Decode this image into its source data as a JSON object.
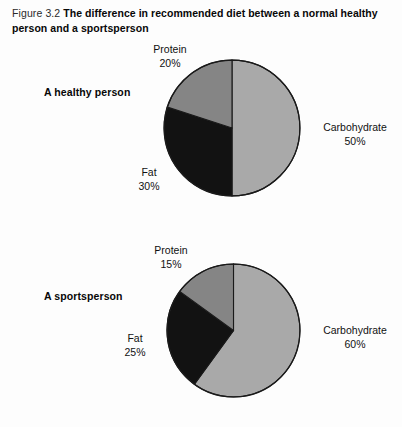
{
  "figure": {
    "number": "Figure 3.2",
    "title": "The difference in recommended diet between a normal healthy person and a sportsperson"
  },
  "colors": {
    "carbohydrate": "#a9a9a9",
    "protein": "#858585",
    "fat": "#121212",
    "outline": "#1a1a1a",
    "background": "#fdfdfd",
    "text": "#111111"
  },
  "chart_data": [
    {
      "type": "pie",
      "title": "A healthy person",
      "categories": [
        "Carbohydrate",
        "Protein",
        "Fat"
      ],
      "values": [
        50,
        30,
        20
      ],
      "labels": [
        "Carbohydrate\n50%",
        "Fat\n30%",
        "Protein\n20%"
      ],
      "slices": [
        {
          "name": "Carbohydrate",
          "value": 50,
          "value_label": "50%",
          "color": "#a9a9a9",
          "start_angle": 0,
          "end_angle": 180
        },
        {
          "name": "Fat",
          "value": 30,
          "value_label": "30%",
          "color": "#121212",
          "start_angle": 180,
          "end_angle": 288
        },
        {
          "name": "Protein",
          "value": 20,
          "value_label": "20%",
          "color": "#858585",
          "start_angle": 288,
          "end_angle": 360
        }
      ],
      "units": "percent",
      "total": 100,
      "legend": "none",
      "grid": false
    },
    {
      "type": "pie",
      "title": "A sportsperson",
      "categories": [
        "Carbohydrate",
        "Protein",
        "Fat"
      ],
      "values": [
        60,
        25,
        15
      ],
      "labels": [
        "Carbohydrate\n60%",
        "Fat\n25%",
        "Protein\n15%"
      ],
      "slices": [
        {
          "name": "Carbohydrate",
          "value": 60,
          "value_label": "60%",
          "color": "#a9a9a9",
          "start_angle": 0,
          "end_angle": 216
        },
        {
          "name": "Fat",
          "value": 25,
          "value_label": "25%",
          "color": "#121212",
          "start_angle": 216,
          "end_angle": 306
        },
        {
          "name": "Protein",
          "value": 15,
          "value_label": "15%",
          "color": "#858585",
          "start_angle": 306,
          "end_angle": 360
        }
      ],
      "units": "percent",
      "total": 100,
      "legend": "none",
      "grid": false
    }
  ],
  "healthy": {
    "subject": "A healthy person",
    "protein_name": "Protein",
    "protein_value": "20%",
    "carb_name": "Carbohydrate",
    "carb_value": "50%",
    "fat_name": "Fat",
    "fat_value": "30%"
  },
  "sports": {
    "subject": "A sportsperson",
    "protein_name": "Protein",
    "protein_value": "15%",
    "carb_name": "Carbohydrate",
    "carb_value": "60%",
    "fat_name": "Fat",
    "fat_value": "25%"
  }
}
